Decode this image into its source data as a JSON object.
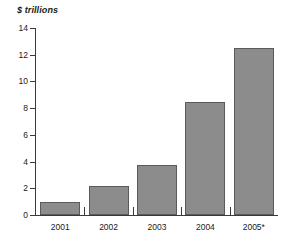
{
  "chart_data": {
    "type": "bar",
    "title": "",
    "subtitle": "",
    "xlabel": "",
    "ylabel": "$ trillions",
    "unit_label": "$ trillions",
    "categories": [
      "2001",
      "2002",
      "2003",
      "2004",
      "2005*"
    ],
    "values": [
      1.0,
      2.15,
      3.75,
      8.45,
      12.5
    ],
    "series": [
      {
        "name": "",
        "values": [
          1.0,
          2.15,
          3.75,
          8.45,
          12.5
        ]
      }
    ],
    "ylim": [
      0,
      14
    ],
    "ytick_labels": [
      "0",
      "2",
      "4",
      "6",
      "8",
      "10",
      "12",
      "14"
    ],
    "ytick_values": [
      0,
      2,
      4,
      6,
      8,
      10,
      12,
      14
    ],
    "grid": false,
    "legend": false,
    "legend_position": "none",
    "annotations": [
      "* denotes projected or estimated value"
    ],
    "colors": {
      "bar_fill": "#8c8c8c",
      "bar_stroke": "#5a5a5a",
      "axis": "#3a3a3a",
      "text": "#1a1a1a",
      "background": "#ffffff"
    }
  }
}
